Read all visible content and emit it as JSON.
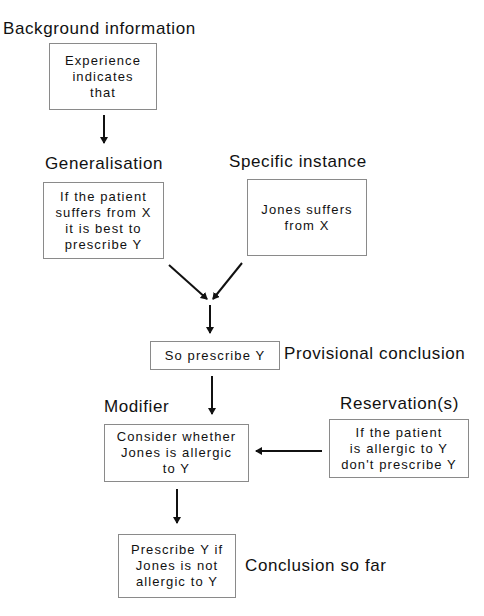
{
  "diagram": {
    "type": "argument-flowchart",
    "labels": {
      "background": "Background information",
      "generalisation": "Generalisation",
      "specific": "Specific instance",
      "provisional": "Provisional conclusion",
      "modifier": "Modifier",
      "reservation": "Reservation(s)",
      "conclusion": "Conclusion so far"
    },
    "boxes": {
      "background": "Experience\nindicates\nthat",
      "generalisation": "If the patient\nsuffers from X\nit is best to\nprescribe Y",
      "specific": "Jones suffers\nfrom X",
      "provisional": "So prescribe Y",
      "modifier": "Consider whether\nJones is allergic\nto Y",
      "reservation": "If the patient\nis allergic to Y\ndon't prescribe Y",
      "conclusion": "Prescribe Y if\nJones is not\nallergic to Y"
    },
    "edges": [
      {
        "from": "background",
        "to": "generalisation"
      },
      {
        "from": "generalisation",
        "to": "provisional"
      },
      {
        "from": "specific",
        "to": "provisional"
      },
      {
        "from": "provisional",
        "to": "modifier"
      },
      {
        "from": "reservation",
        "to": "modifier"
      },
      {
        "from": "modifier",
        "to": "conclusion"
      }
    ],
    "colors": {
      "line": "#111111",
      "box_border": "#8a8a8a",
      "background": "#ffffff"
    }
  }
}
